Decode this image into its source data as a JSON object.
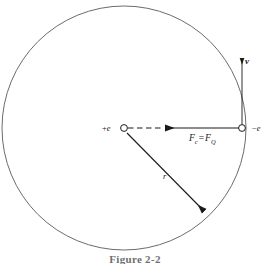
{
  "figure": {
    "type": "physics-diagram",
    "background_color": "#ffffff",
    "stroke_color": "#1a1a1a",
    "circle_stroke_color": "#5a5a5a",
    "caption": "Figure 2-2",
    "orbit": {
      "center_x": 124,
      "center_y": 128,
      "radius": 122
    },
    "center_particle": {
      "label_sign": "+",
      "label_symbol": "e",
      "x": 124,
      "y": 128,
      "marker": "open-circle"
    },
    "orbiting_particle": {
      "label_sign": "−",
      "label_symbol": "e",
      "x": 242,
      "y": 128,
      "marker": "open-circle"
    },
    "force_vector": {
      "label_lhs_symbol": "F",
      "label_lhs_subscript": "c",
      "label_operator": "=",
      "label_rhs_symbol": "F",
      "label_rhs_subscript": "Q",
      "direction": "left",
      "from_x": 242,
      "from_y": 128,
      "to_x": 163,
      "to_y": 128,
      "dashed_from_x": 126,
      "dashed_to_x": 163
    },
    "velocity_vector": {
      "label": "v",
      "direction": "up",
      "from_x": 242,
      "from_y": 128,
      "to_x": 242,
      "to_y": 56
    },
    "radius_vector": {
      "label": "r",
      "from_x": 127,
      "from_y": 133,
      "to_x": 207,
      "to_y": 214
    }
  }
}
